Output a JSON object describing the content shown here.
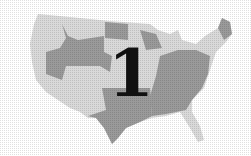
{
  "figure": {
    "label": "1",
    "colors": {
      "light_states": "#d9d9d9",
      "dark_states": "#9a9a9a",
      "label": "#111111",
      "background": "#ffffff"
    }
  }
}
